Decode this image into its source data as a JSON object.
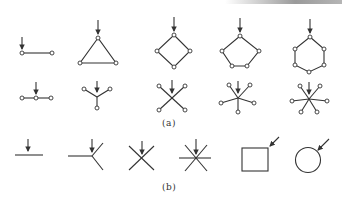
{
  "figure": {
    "panels": [
      {
        "label": "(a)",
        "description": "Graph structures with nodes (small circles); arrows mark the indicated node",
        "rows": [
          {
            "name": "cycle-row",
            "items": [
              "2-node chain",
              "triangle (3-cycle)",
              "square (4-cycle)",
              "pentagon (5-cycle)",
              "hexagon (6-cycle)"
            ]
          },
          {
            "name": "star-row",
            "items": [
              "3-node chain",
              "3-arm star",
              "4-arm star",
              "5-arm star",
              "6-arm star"
            ]
          }
        ]
      },
      {
        "label": "(b)",
        "description": "Simplified line symbols; arrows mark the indicated element",
        "items": [
          "line",
          "Y-junction (3 arms)",
          "X-junction (4 arms)",
          "6-arm asterisk",
          "square",
          "circle"
        ]
      }
    ],
    "colors": {
      "stroke": "#333333",
      "background": "#ffffff"
    }
  }
}
